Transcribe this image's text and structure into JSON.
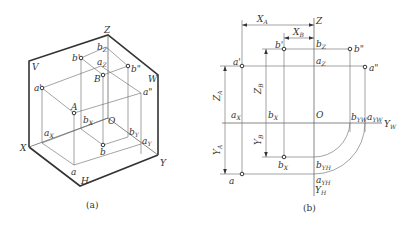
{
  "figure_a": {
    "caption": "(a)",
    "planes": {
      "V": "V",
      "W": "W",
      "H": "H"
    },
    "axes": {
      "X": "X",
      "Y": "Y",
      "Z": "Z",
      "O": "O"
    },
    "points": {
      "A": "A",
      "B": "B",
      "a_prime": "a'",
      "b_prime": "b'",
      "a_dprime": "a\"",
      "b_dprime": "b\"",
      "a": "a",
      "b": "b"
    },
    "axis_points": {
      "a_X": "a",
      "a_X_sub": "X",
      "b_X": "b",
      "b_X_sub": "X",
      "a_Y": "a",
      "a_Y_sub": "Y",
      "b_Y": "b",
      "b_Y_sub": "Y",
      "a_Z": "a",
      "a_Z_sub": "Z",
      "b_Z": "b",
      "b_Z_sub": "Z"
    }
  },
  "figure_b": {
    "caption": "(b)",
    "axes": {
      "Z": "Z",
      "O": "O",
      "Y_W": "Y",
      "Y_W_sub": "W",
      "Y_H": "Y",
      "Y_H_sub": "H"
    },
    "dimensions": {
      "X_A": "X",
      "X_A_sub": "A",
      "X_B": "X",
      "X_B_sub": "B",
      "Z_A": "Z",
      "Z_A_sub": "A",
      "Z_B": "Z",
      "Z_B_sub": "B",
      "Y_A": "Y",
      "Y_A_sub": "A",
      "Y_B": "Y",
      "Y_B_sub": "B"
    },
    "points": {
      "a_prime": "a'",
      "b_prime": "b'",
      "a_dprime": "a\"",
      "b_dprime": "b\"",
      "a": "a",
      "b": "b",
      "b_label": "X"
    },
    "axis_points": {
      "a_X": "a",
      "a_X_sub": "X",
      "b_X": "b",
      "b_X_sub": "X",
      "a_Z": "a",
      "a_Z_sub": "Z",
      "b_Z": "b",
      "b_Z_sub": "Z",
      "b_YW": "b",
      "b_YW_sub": "YW",
      "a_YW": "a",
      "a_YW_sub": "YW",
      "b_YH": "b",
      "b_YH_sub": "YH",
      "a_YH": "a",
      "a_YH_sub": "YH"
    }
  }
}
